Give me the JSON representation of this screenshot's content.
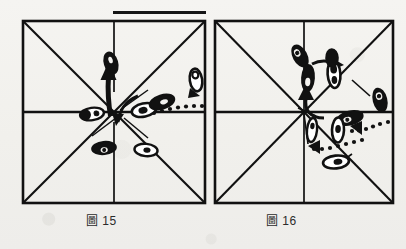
{
  "page": {
    "kind": "scanned-book-figure-pair",
    "background_color": "#f3f2ef",
    "ink_color": "#111111"
  },
  "figures": [
    {
      "id": "figure-15",
      "caption_cjk": "圖",
      "caption_number": "15",
      "caption_full": "圖 15",
      "frame": {
        "shape": "square",
        "guides": [
          "border",
          "diagonal-tl-br",
          "diagonal-tr-bl",
          "horizontal-midline",
          "vertical-centerline"
        ],
        "line_color": "#111111"
      },
      "marks": {
        "footprints": 7,
        "solid_arrows": 2,
        "dotted_arrows": 1,
        "description": "footwork marks clustered at centre, one pair stepping up the vertical centreline, dotted trail entering from the right edge"
      }
    },
    {
      "id": "figure-16",
      "caption_cjk": "圖",
      "caption_number": "16",
      "caption_full": "圖 16",
      "frame": {
        "shape": "square",
        "guides": [
          "border",
          "diagonal-tl-br",
          "diagonal-tr-bl",
          "horizontal-midline",
          "vertical-centerline"
        ],
        "line_color": "#111111"
      },
      "marks": {
        "footprints": 9,
        "solid_arrows": 3,
        "dotted_arrows": 2,
        "description": "footwork marks in the upper-right quadrant and around the centre, curved arrow sweeping up from centre, dotted trails entering from the right edge"
      }
    }
  ],
  "artifacts": {
    "stray_rule_label": "stray black rule above the upper-right of figure 15"
  }
}
